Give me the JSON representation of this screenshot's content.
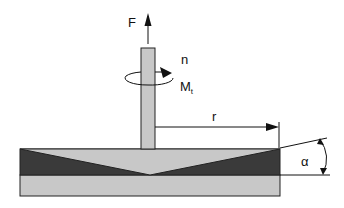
{
  "diagram": {
    "type": "cone-plate rheometer schematic",
    "labels": {
      "force": "F",
      "speed": "n",
      "torque": "M",
      "torque_sub": "t",
      "radius": "r",
      "angle": "α"
    },
    "colors": {
      "shaft": "#c8c8c8",
      "cone": "#c8c8c8",
      "sample": "#3a3a3a",
      "plate": "#c8c8c8",
      "stroke": "#222222"
    }
  }
}
